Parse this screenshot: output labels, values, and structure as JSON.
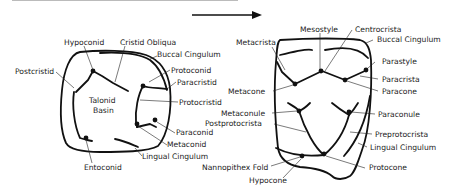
{
  "figure": {
    "arrow": "right-arrow",
    "left_tooth": {
      "name": "lower molar (talonid/trigonid)",
      "labels": {
        "hypoconid": "Hypoconid",
        "cristid_obliqua": "Cristid Obliqua",
        "buccal_cingulum": "Buccal Cingulum",
        "postcristid": "Postcristid",
        "protoconid": "Protoconid",
        "paracristid": "Paracristid",
        "talonid_basin_1": "Talonid",
        "talonid_basin_2": "Basin",
        "protocristid": "Protocristid",
        "paraconid": "Paraconid",
        "metaconid": "Metaconid",
        "lingual_cingulum": "Lingual Cingulum",
        "entoconid": "Entoconid"
      }
    },
    "right_tooth": {
      "name": "upper molar",
      "labels": {
        "mesostyle": "Mesostyle",
        "centrocrista": "Centrocrista",
        "metacrista": "Metacrista",
        "buccal_cingulum": "Buccal Cingulum",
        "parastyle": "Parastyle",
        "paracrista": "Paracrista",
        "metacone": "Metacone",
        "paracone": "Paracone",
        "metaconule": "Metaconule",
        "paraconule": "Paraconule",
        "postprotocrista": "Postprotocrista",
        "preprotocrista": "Preprotocrista",
        "lingual_cingulum": "Lingual Cingulum",
        "nannopithex_fold": "Nannopithex Fold",
        "protocone": "Protocone",
        "hypocone": "Hypocone"
      }
    }
  }
}
